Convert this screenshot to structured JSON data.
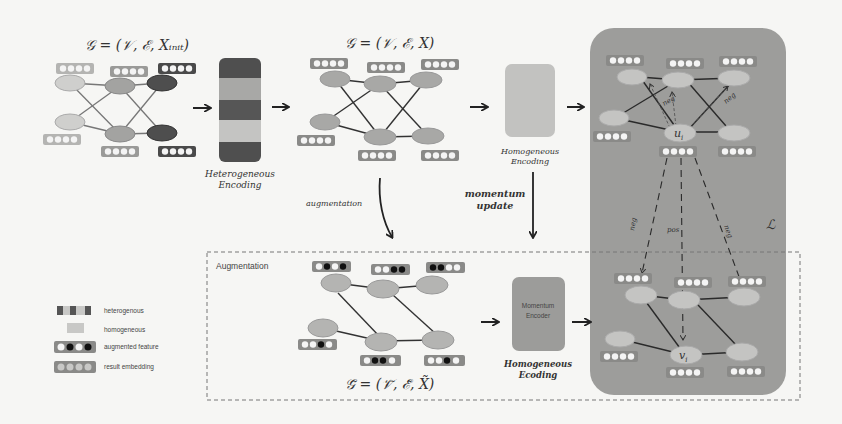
{
  "colors": {
    "background": "#f6f6f4",
    "panel": "#9c9c9a",
    "node_light": "#c4c4c2",
    "node_mid": "#9e9e9c",
    "node_dark": "#555555",
    "embed_box": "#8a8a88",
    "edge": "#333333"
  },
  "stage1": {
    "formula": "𝒢 = (𝒱, ℰ, X_init)",
    "formula_display": "𝒢 = (𝒱, ℰ, Xᵢₙᵢₜ)"
  },
  "heterogeneous_encoding": {
    "label_line1": "Heterogeneous",
    "label_line2": "Encoding"
  },
  "stage2": {
    "formula_display": "𝒢 = (𝒱, ℰ, X)"
  },
  "homogeneous_encoding": {
    "label_line1": "Homogeneous",
    "label_line2": "Encoding"
  },
  "arrows": {
    "augmentation_label": "augmentation",
    "momentum_line1": "momentum",
    "momentum_line2": "update"
  },
  "augmentation_box": {
    "title": "Augmentation",
    "formula_display": "𝒢̃ = (𝒱̃, ℰ̃, X̃)"
  },
  "momentum_encoder": {
    "label_line1": "Momentum",
    "label_line2": "Encoder",
    "caption_line1": "Homogeneous",
    "caption_line2": "Ecoding"
  },
  "loss_panel": {
    "loss_symbol": "ℒ",
    "anchor_node": "u",
    "anchor_sub": "i",
    "target_node": "v",
    "target_sub": "i",
    "edge_labels": {
      "neg_top_left": "neg",
      "neg_top_right": "neg",
      "neg_left": "neg",
      "pos": "pos",
      "neg_right": "neg"
    }
  },
  "legend": {
    "items": [
      {
        "icon": "heterogeneous-swatch",
        "label": "heterogenous"
      },
      {
        "icon": "homogeneous-swatch",
        "label": "homogeneous"
      },
      {
        "icon": "augmented-feature-swatch",
        "label": "augmented feature"
      },
      {
        "icon": "result-embedding-swatch",
        "label": "result embedding"
      }
    ]
  }
}
